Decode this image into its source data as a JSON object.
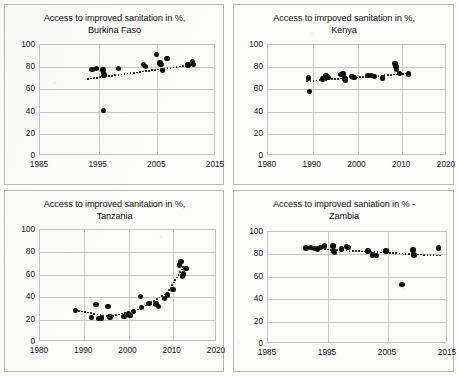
{
  "figure": {
    "background_color": "#fcfcfa",
    "dot_color": "#0c0c0c",
    "grid_color": "#c9c9c9",
    "panel_border_color": "#b9b9b9",
    "layout": "2x2 grid of scatter panels"
  },
  "panels": [
    {
      "id": "burkina-faso",
      "chart_data": {
        "type": "scatter",
        "title": "Access to improved sanitation in %,\nBurkina Faso",
        "country": "Burkina Faso",
        "xlabel": "",
        "ylabel": "",
        "xlim": [
          1985,
          2015
        ],
        "ylim": [
          0,
          100
        ],
        "xticks": [
          "1985",
          "1995",
          "2005",
          "2015"
        ],
        "yticks": [
          "0",
          "20",
          "40",
          "60",
          "80",
          "100"
        ],
        "grid": true,
        "legend": "none",
        "series": [
          {
            "name": "Access to improved sanitation (%)",
            "points": [
              [
                1994.0,
                77.0
              ],
              [
                1994.8,
                78.0
              ],
              [
                1995.9,
                76.5
              ],
              [
                1996.0,
                73.5
              ],
              [
                1996.1,
                72.0
              ],
              [
                1996.0,
                40.0
              ],
              [
                1998.5,
                78.0
              ],
              [
                2002.8,
                81.5
              ],
              [
                2003.2,
                80.0
              ],
              [
                2005.0,
                90.5
              ],
              [
                2005.6,
                83.0
              ],
              [
                2005.8,
                81.5
              ],
              [
                2006.0,
                76.0
              ],
              [
                2006.8,
                87.0
              ],
              [
                2010.4,
                81.0
              ],
              [
                2011.2,
                84.0
              ],
              [
                2011.3,
                81.5
              ]
            ]
          }
        ],
        "trendline": {
          "style": "dotted",
          "points": [
            [
              1993.3,
              68.5
            ],
            [
              2011.6,
              81.5
            ]
          ]
        },
        "annotations": [
          "one low outlier near 1996 at about 40%"
        ]
      }
    },
    {
      "id": "kenya",
      "chart_data": {
        "type": "scatter",
        "title": "Access to imrpoved sanitation in %,\nKenya",
        "country": "Kenya",
        "xlabel": "",
        "ylabel": "",
        "xlim": [
          1980,
          2020
        ],
        "ylim": [
          0,
          100
        ],
        "xticks": [
          "1980",
          "1990",
          "2000",
          "2010",
          "2020"
        ],
        "yticks": [
          "0",
          "20",
          "40",
          "60",
          "80",
          "100"
        ],
        "grid": true,
        "legend": "none",
        "series": [
          {
            "name": "Access to improved sanitation (%)",
            "points": [
              [
                1989.3,
                69.5
              ],
              [
                1989.5,
                57.0
              ],
              [
                1992.4,
                68.5
              ],
              [
                1993.2,
                71.5
              ],
              [
                1993.4,
                71.0
              ],
              [
                1993.6,
                70.0
              ],
              [
                1996.5,
                72.5
              ],
              [
                1997.0,
                73.0
              ],
              [
                1997.4,
                68.5
              ],
              [
                1997.6,
                67.5
              ],
              [
                1999.0,
                70.5
              ],
              [
                1999.4,
                70.0
              ],
              [
                2002.6,
                71.5
              ],
              [
                2003.3,
                71.5
              ],
              [
                2004.0,
                71.0
              ],
              [
                2005.8,
                69.5
              ],
              [
                2008.6,
                82.5
              ],
              [
                2008.8,
                79.5
              ],
              [
                2008.9,
                77.0
              ],
              [
                2009.6,
                73.5
              ],
              [
                2011.6,
                73.0
              ]
            ]
          }
        ],
        "trendline": {
          "style": "dotted",
          "points": [
            [
              1989.0,
              66.5
            ],
            [
              2011.8,
              73.5
            ]
          ]
        },
        "annotations": [
          "one low outlier near 1990 at about 57%"
        ]
      }
    },
    {
      "id": "tanzania",
      "chart_data": {
        "type": "scatter",
        "title": "Access to improved sanitation in %,\nTanzania",
        "country": "Tanzania",
        "xlabel": "",
        "ylabel": "",
        "xlim": [
          1980,
          2020
        ],
        "ylim": [
          0,
          100
        ],
        "xticks": [
          "1980",
          "1990",
          "2000",
          "2010",
          "2020"
        ],
        "yticks": [
          "0",
          "20",
          "40",
          "60",
          "80",
          "100"
        ],
        "grid": true,
        "legend": "none",
        "series": [
          {
            "name": "Access to improved sanitation (%)",
            "points": [
              [
                1988.3,
                27.5
              ],
              [
                1991.8,
                21.0
              ],
              [
                1992.9,
                32.5
              ],
              [
                1993.4,
                20.0
              ],
              [
                1994.1,
                20.5
              ],
              [
                1995.6,
                31.0
              ],
              [
                1996.0,
                21.5
              ],
              [
                1999.2,
                22.0
              ],
              [
                2000.2,
                24.0
              ],
              [
                2000.6,
                23.0
              ],
              [
                2001.3,
                26.5
              ],
              [
                2002.9,
                39.5
              ],
              [
                2003.2,
                30.0
              ],
              [
                2004.9,
                33.5
              ],
              [
                2006.4,
                33.0
              ],
              [
                2007.0,
                31.0
              ],
              [
                2008.3,
                38.0
              ],
              [
                2009.1,
                41.0
              ],
              [
                2010.3,
                46.0
              ],
              [
                2011.8,
                68.0
              ],
              [
                2012.1,
                71.0
              ],
              [
                2012.4,
                58.0
              ],
              [
                2012.6,
                60.0
              ],
              [
                2013.2,
                65.0
              ]
            ]
          }
        ],
        "trendline": {
          "style": "dotted",
          "points": [
            [
              1988.3,
              27.5
            ],
            [
              1996.0,
              21.5
            ],
            [
              2003.0,
              29.0
            ],
            [
              2009.0,
              43.0
            ],
            [
              2012.6,
              66.0
            ]
          ]
        },
        "annotations": [
          "rising curve after 2000"
        ]
      }
    },
    {
      "id": "zambia",
      "chart_data": {
        "type": "scatter",
        "title": "Access to improved saniation in % -\nZambia",
        "country": "Zambia",
        "xlabel": "",
        "ylabel": "",
        "xlim": [
          1985,
          2015
        ],
        "ylim": [
          0,
          100
        ],
        "xticks": [
          "1985",
          "1995",
          "2005",
          "2015"
        ],
        "yticks": [
          "0",
          "20",
          "40",
          "60",
          "80",
          "100"
        ],
        "grid": true,
        "legend": "none",
        "series": [
          {
            "name": "Access to improved sanitation (%)",
            "points": [
              [
                1991.5,
                85.0
              ],
              [
                1992.2,
                85.5
              ],
              [
                1992.9,
                84.5
              ],
              [
                1993.4,
                84.0
              ],
              [
                1993.9,
                85.5
              ],
              [
                1994.6,
                86.5
              ],
              [
                1996.0,
                86.5
              ],
              [
                1996.1,
                82.0
              ],
              [
                1996.2,
                81.0
              ],
              [
                1997.4,
                84.0
              ],
              [
                1998.2,
                86.0
              ],
              [
                1998.5,
                85.5
              ],
              [
                2001.8,
                82.0
              ],
              [
                2002.6,
                78.5
              ],
              [
                2003.2,
                78.0
              ],
              [
                2004.8,
                82.0
              ],
              [
                2007.5,
                52.0
              ],
              [
                2009.3,
                83.0
              ],
              [
                2009.5,
                78.5
              ],
              [
                2013.6,
                85.0
              ]
            ]
          }
        ],
        "trendline": {
          "style": "dotted",
          "points": [
            [
              1991.5,
              84.5
            ],
            [
              2013.8,
              78.0
            ]
          ]
        },
        "annotations": [
          "one low outlier near 2007 at about 52%"
        ]
      }
    }
  ]
}
